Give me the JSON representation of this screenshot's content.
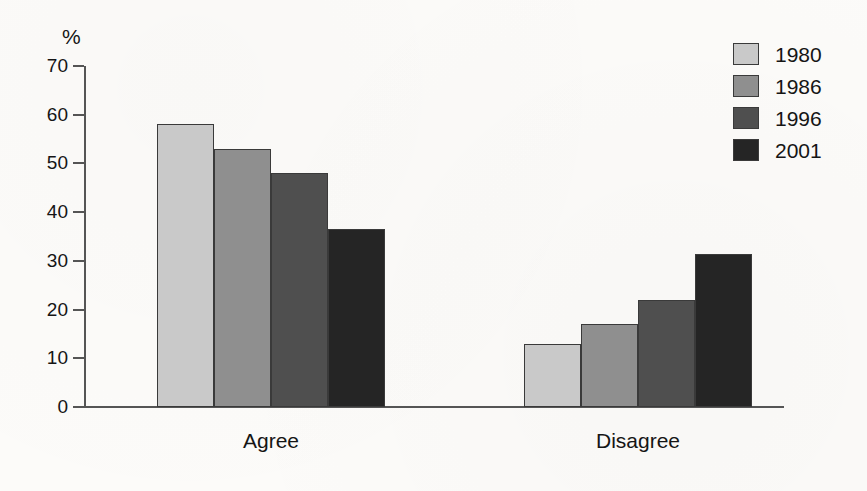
{
  "chart_data": {
    "type": "bar",
    "title": "",
    "subtitle": "",
    "xlabel": "",
    "ylabel": "%",
    "ylim": [
      0,
      70
    ],
    "ytick_step": 10,
    "yticks": [
      70,
      60,
      50,
      40,
      30,
      20,
      10,
      0
    ],
    "grid": false,
    "legend_position": "top-right",
    "categories": [
      "Agree",
      "Disagree"
    ],
    "series": [
      {
        "name": "1980",
        "values": [
          58,
          13
        ],
        "color": "#c9c9c9"
      },
      {
        "name": "1986",
        "values": [
          53,
          17
        ],
        "color": "#8f8f8f"
      },
      {
        "name": "1996",
        "values": [
          48,
          22
        ],
        "color": "#4f4f4f"
      },
      {
        "name": "2001",
        "values": [
          36.5,
          31.5
        ],
        "color": "#252525"
      }
    ],
    "annotations": []
  },
  "axis": {
    "unit_label": "%",
    "tick_labels": [
      "70",
      "60",
      "50",
      "40",
      "30",
      "20",
      "10",
      "0"
    ]
  },
  "legend": {
    "entries": [
      {
        "label": "1980",
        "color": "#c9c9c9"
      },
      {
        "label": "1986",
        "color": "#8f8f8f"
      },
      {
        "label": "1996",
        "color": "#4f4f4f"
      },
      {
        "label": "2001",
        "color": "#252525"
      }
    ]
  },
  "category_labels": [
    "Agree",
    "Disagree"
  ]
}
